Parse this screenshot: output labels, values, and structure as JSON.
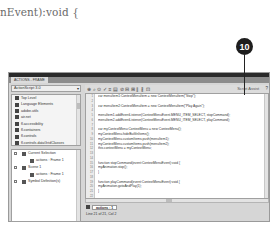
{
  "caption": "nEvent):void {",
  "callout": {
    "number": "10"
  },
  "window": {
    "panel_tab": "ACTIONS - FRAME",
    "left_panel": {
      "version_selector": "ActionScript 3.0",
      "toolbox_items": [
        "Top Level",
        "Language Elements",
        "adobe.utils",
        "air.net",
        "fl.accessibility",
        "fl.containers",
        "fl.controls",
        "fl.controls.dataGridClasses",
        "fl.controls.listClasses"
      ],
      "script_navigator": [
        {
          "label": "Current Selection",
          "level": 0,
          "type": "folder"
        },
        {
          "label": "actions : Frame 1",
          "level": 1,
          "type": "frame"
        },
        {
          "label": "Scene 1",
          "level": 0,
          "type": "scene"
        },
        {
          "label": "actions : Frame 1",
          "level": 1,
          "type": "frame"
        },
        {
          "label": "Symbol Definition(s)",
          "level": 0,
          "type": "symbol"
        }
      ]
    },
    "toolbar": {
      "icons": [
        "add-icon",
        "find-icon",
        "target-icon",
        "check-syntax-icon",
        "autoformat-icon",
        "code-hint-icon",
        "debug-icon",
        "collapse-icon",
        "expand-icon",
        "comment-icon",
        "uncomment-icon",
        "toggle-icon"
      ],
      "script_assist": "Script Assist",
      "help": "?"
    },
    "editor": {
      "line_numbers": [
        "1",
        "2",
        "3",
        "4",
        "5",
        "6",
        "7",
        "8",
        "9",
        "10",
        "11",
        "12",
        "13",
        "14",
        "15",
        "16",
        "17",
        "18",
        "19",
        "20",
        "21",
        "22"
      ],
      "lines": [
        "var menuItem1:ContextMenuItem = new ContextMenuItem(\"Stop\");",
        "",
        "var menuItem2:ContextMenuItem = new ContextMenuItem(\"Play Again\");",
        "",
        "menuItem1.addEventListener(ContextMenuEvent.MENU_ITEM_SELECT, stopCommand);",
        "menuItem2.addEventListener(ContextMenuEvent.MENU_ITEM_SELECT, playCommand);",
        "",
        "var myContextMenu:ContextMenu = new ContextMenu();",
        "myContextMenu.hideBuiltInItems();",
        "myContextMenu.customItems.push(menuItem1);",
        "myContextMenu.customItems.push(menuItem2);",
        "this.contextMenu = myContextMenu;",
        "",
        "",
        "function stopCommand(event:ContextMenuEvent):void {",
        "myAnimation.stop();",
        "}",
        "",
        "function playCommand(event:ContextMenuEvent):void {",
        "myAnimation.gotoAndPlay(1);",
        "}",
        ""
      ]
    },
    "script_tab": "actions : 1",
    "status": "Line 21 of 21, Col 2"
  }
}
